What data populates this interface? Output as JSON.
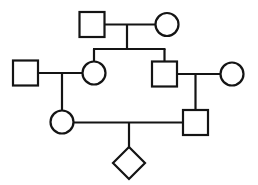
{
  "diagram": {
    "type": "pedigree",
    "canvas": {
      "width": 258,
      "height": 185,
      "background": "#ffffff"
    },
    "style": {
      "line_color": "#141414",
      "fill_color": "#ffffff",
      "stroke_width": 2.2,
      "square_size": 25,
      "circle_radius": 11.5,
      "diamond_half": 16
    },
    "legend": {
      "square_meaning": "male",
      "circle_meaning": "female",
      "diamond_meaning": "sex unknown",
      "horizontal_line_meaning": "mating / partnership line",
      "vertical_line_meaning": "descent line",
      "sibship_line_meaning": "sibship line"
    },
    "generations": [
      {
        "id": "generation-1",
        "label": "I",
        "members": [
          {
            "id": "i-1",
            "name": "grandfather",
            "shape": "square",
            "sex": "male",
            "x": 92,
            "y": 24.5,
            "size": 25
          },
          {
            "id": "i-2",
            "name": "grandmother",
            "shape": "circle",
            "sex": "female",
            "x": 167,
            "y": 24.5,
            "r": 11.5
          }
        ]
      },
      {
        "id": "generation-2",
        "label": "II",
        "members": [
          {
            "id": "ii-1",
            "name": "son-in-law-left",
            "shape": "square",
            "sex": "male",
            "x": 25.5,
            "y": 73,
            "size": 25
          },
          {
            "id": "ii-2",
            "name": "daughter",
            "shape": "circle",
            "sex": "female",
            "x": 94,
            "y": 73,
            "r": 11.5
          },
          {
            "id": "ii-3",
            "name": "son",
            "shape": "square",
            "sex": "male",
            "x": 164.5,
            "y": 74,
            "size": 25
          },
          {
            "id": "ii-4",
            "name": "daughter-in-law-right",
            "shape": "circle",
            "sex": "female",
            "x": 232,
            "y": 74,
            "r": 11.5
          }
        ]
      },
      {
        "id": "generation-3",
        "label": "III",
        "members": [
          {
            "id": "iii-1",
            "name": "granddaughter",
            "shape": "circle",
            "sex": "female",
            "x": 62,
            "y": 122,
            "r": 11.5
          },
          {
            "id": "iii-2",
            "name": "grandson",
            "shape": "square",
            "sex": "male",
            "x": 195.5,
            "y": 122.5,
            "size": 25
          }
        ]
      },
      {
        "id": "generation-4",
        "label": "IV",
        "members": [
          {
            "id": "iv-1",
            "name": "great-grandchild",
            "shape": "diamond",
            "sex": "unknown",
            "x": 129,
            "y": 163,
            "half": 16
          }
        ]
      }
    ],
    "unions": [
      {
        "id": "union-1",
        "name": "union-grandparents",
        "partners": [
          "i-1",
          "i-2"
        ],
        "line_y": 24.5,
        "x_from": 104.5,
        "x_to": 155.5,
        "drop_x": 127,
        "drop_to_y": 49
      },
      {
        "id": "union-2",
        "name": "union-generation2-left",
        "partners": [
          "ii-1",
          "ii-2"
        ],
        "line_y": 73,
        "x_from": 38,
        "x_to": 82.5,
        "drop_x": 62,
        "drop_to_y": 110.5
      },
      {
        "id": "union-3",
        "name": "union-generation2-right",
        "partners": [
          "ii-3",
          "ii-4"
        ],
        "line_y": 74,
        "x_from": 177,
        "x_to": 220.5,
        "drop_x": 195.5,
        "drop_to_y": 110
      },
      {
        "id": "union-4",
        "name": "union-generation3",
        "partners": [
          "iii-1",
          "iii-2"
        ],
        "line_y": 122.5,
        "x_from": 73.5,
        "x_to": 183,
        "drop_x": 129,
        "drop_to_y": 147
      }
    ],
    "sibships": [
      {
        "id": "sibship-1",
        "name": "sibship-generation2",
        "parent_union": "union-1",
        "line_y": 49,
        "x_from": 94,
        "x_to": 164.5,
        "children": [
          "ii-2",
          "ii-3"
        ],
        "child_drops": [
          {
            "x": 94,
            "to_y": 61.5
          },
          {
            "x": 164.5,
            "to_y": 61.5
          }
        ]
      }
    ]
  }
}
